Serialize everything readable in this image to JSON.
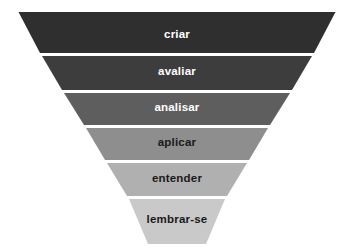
{
  "figure": {
    "name": "inverted-pyramid-diagram",
    "background_color": "#ffffff",
    "separator_color": "#ffffff",
    "width": 354,
    "height": 250
  },
  "chart_data": {
    "type": "funnel",
    "title": "",
    "subtitle": "",
    "xlabel": "",
    "ylabel": "",
    "orientation": "inverted-pyramid",
    "legend": "none",
    "grid": false,
    "categories": [
      "criar",
      "avaliar",
      "analisar",
      "aplicar",
      "entender",
      "lembrar-se"
    ],
    "values": [
      6,
      5,
      4,
      3,
      2,
      1
    ],
    "levels": [
      {
        "label": "criar",
        "level": 6,
        "fill": "#2f2f2f",
        "text_color": "#ffffff",
        "top_width": 317,
        "bottom_width": 274,
        "y_top": 12,
        "y_bottom": 53,
        "label_y": 29
      },
      {
        "label": "avaliar",
        "level": 5,
        "fill": "#3d3d3d",
        "text_color": "#ffffff",
        "top_width": 270,
        "bottom_width": 230,
        "y_top": 56,
        "y_bottom": 90,
        "label_y": 66
      },
      {
        "label": "analisar",
        "level": 4,
        "fill": "#5e5e5e",
        "text_color": "#ffffff",
        "top_width": 226,
        "bottom_width": 186,
        "y_top": 93,
        "y_bottom": 125,
        "label_y": 102
      },
      {
        "label": "aplicar",
        "level": 3,
        "fill": "#8e8e8e",
        "text_color": "#1a1a1a",
        "top_width": 182,
        "bottom_width": 144,
        "y_top": 128,
        "y_bottom": 160,
        "label_y": 137
      },
      {
        "label": "entender",
        "level": 2,
        "fill": "#b0b0b0",
        "text_color": "#1a1a1a",
        "top_width": 140,
        "bottom_width": 100,
        "y_top": 163,
        "y_bottom": 196,
        "label_y": 173
      },
      {
        "label": "lembrar-se",
        "level": 1,
        "fill": "#c9c9c9",
        "text_color": "#1a1a1a",
        "top_width": 96,
        "bottom_width": 58,
        "y_top": 199,
        "y_bottom": 244,
        "label_y": 214
      }
    ]
  }
}
